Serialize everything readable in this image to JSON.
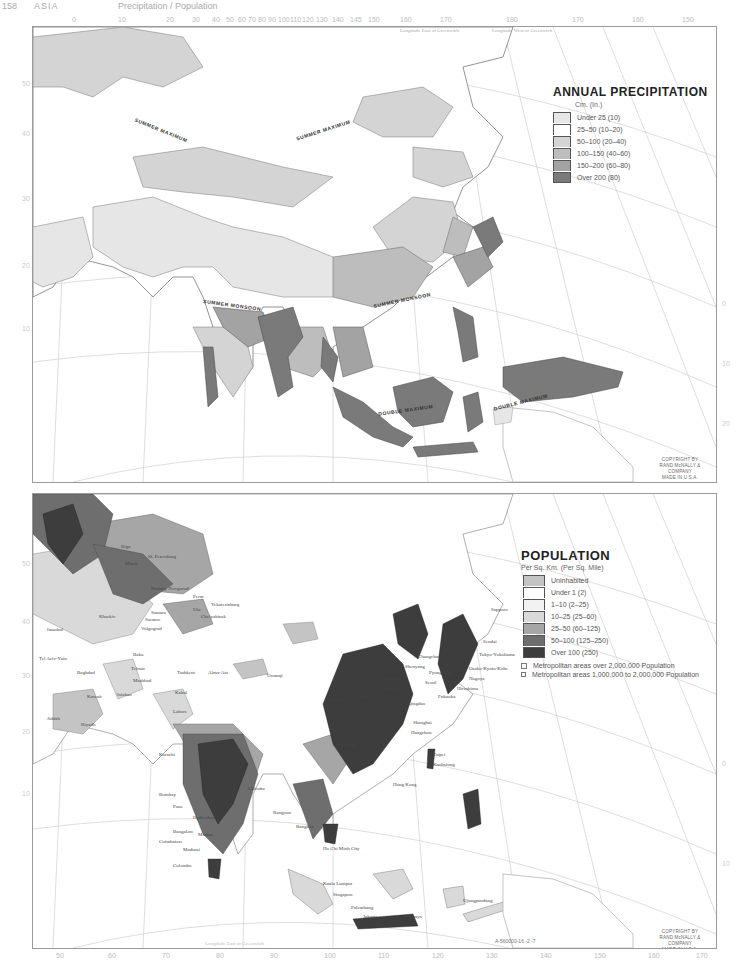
{
  "page": {
    "number": "158",
    "section": "ASIA",
    "subtitle": "Precipitation / Population"
  },
  "precipitation_map": {
    "legend": {
      "title": "ANNUAL PRECIPITATION",
      "unit": "Cm. (In.)",
      "items": [
        {
          "label": "Under 25 (10)",
          "color": "#e6e6e6"
        },
        {
          "label": "25–50 (10–20)",
          "color": "#ffffff"
        },
        {
          "label": "50–100 (20–40)",
          "color": "#d4d4d4"
        },
        {
          "label": "100–150 (40–60)",
          "color": "#bdbdbd"
        },
        {
          "label": "150–200 (60–80)",
          "color": "#a3a3a3"
        },
        {
          "label": "Over 200 (80)",
          "color": "#7a7a7a"
        }
      ]
    },
    "region_labels": [
      {
        "text": "SUMMER MAXIMUM",
        "x": 100,
        "y": 100,
        "rotate": 22
      },
      {
        "text": "SUMMER MAXIMUM",
        "x": 262,
        "y": 100,
        "rotate": -18
      },
      {
        "text": "SUMMER MONSOON",
        "x": 170,
        "y": 275,
        "rotate": 8
      },
      {
        "text": "SUMMER MONSOON",
        "x": 340,
        "y": 270,
        "rotate": -12
      },
      {
        "text": "DOUBLE MAXIMUM",
        "x": 345,
        "y": 380,
        "rotate": -8
      },
      {
        "text": "DOUBLE MAXIMUM",
        "x": 460,
        "y": 372,
        "rotate": -14
      }
    ],
    "top_ticks": [
      "0",
      "10",
      "20",
      "30",
      "40",
      "50",
      "60",
      "70",
      "80",
      "90",
      "100",
      "110",
      "120",
      "130",
      "140",
      "145",
      "150",
      "160",
      "170",
      "180",
      "170",
      "160",
      "150"
    ],
    "top_caption_east": "Longitude East of Greenwich",
    "top_caption_west": "Longitude West of Greenwich",
    "side_ticks": [
      "50",
      "40",
      "30",
      "20",
      "10",
      "0",
      "10",
      "20"
    ],
    "copyright": [
      "COPYRIGHT BY",
      "RAND McNALLY & COMPANY",
      "MADE IN U.S.A."
    ]
  },
  "population_map": {
    "legend": {
      "title": "POPULATION",
      "unit": "Per Sq. Km. (Per Sq. Mile)",
      "items": [
        {
          "label": "Uninhabited",
          "color": "#c4c4c4"
        },
        {
          "label": "Under 1 (2)",
          "color": "#ffffff"
        },
        {
          "label": "1–10 (2–25)",
          "color": "#f2f2f2"
        },
        {
          "label": "10–25 (25–60)",
          "color": "#d9d9d9"
        },
        {
          "label": "25–50 (60–125)",
          "color": "#a6a6a6"
        },
        {
          "label": "50–100 (125–250)",
          "color": "#6e6e6e"
        },
        {
          "label": "Over 100 (250)",
          "color": "#3d3d3d"
        }
      ],
      "metro": [
        {
          "label": "Metropolitan areas over 2,000,000 Population",
          "symbol": "square-large"
        },
        {
          "label": "Metropolitan areas 1,000,000 to 2,000,000 Population",
          "symbol": "square-small"
        }
      ]
    },
    "cities": [
      {
        "name": "Riga",
        "x": 88,
        "y": 50
      },
      {
        "name": "Minsk",
        "x": 92,
        "y": 67
      },
      {
        "name": "St. Petersburg",
        "x": 115,
        "y": 60
      },
      {
        "name": "Nizhniy Novgorod",
        "x": 118,
        "y": 92
      },
      {
        "name": "Perm",
        "x": 160,
        "y": 100
      },
      {
        "name": "Ufa",
        "x": 160,
        "y": 113
      },
      {
        "name": "Yekaterinburg",
        "x": 178,
        "y": 112
      },
      {
        "name": "Chelyabinsk",
        "x": 168,
        "y": 120
      },
      {
        "name": "Samara",
        "x": 118,
        "y": 116
      },
      {
        "name": "Saratov",
        "x": 112,
        "y": 123
      },
      {
        "name": "Volgograd",
        "x": 108,
        "y": 132
      },
      {
        "name": "Kharkiv",
        "x": 66,
        "y": 120
      },
      {
        "name": "Istanbul",
        "x": 14,
        "y": 133
      },
      {
        "name": "Tel Aviv-Yafo",
        "x": 6,
        "y": 162
      },
      {
        "name": "Baghdad",
        "x": 44,
        "y": 176
      },
      {
        "name": "Baku",
        "x": 100,
        "y": 158
      },
      {
        "name": "Tehran",
        "x": 98,
        "y": 172
      },
      {
        "name": "Mashhad",
        "x": 100,
        "y": 184
      },
      {
        "name": "Riyadh",
        "x": 48,
        "y": 228
      },
      {
        "name": "Kuwait",
        "x": 54,
        "y": 200
      },
      {
        "name": "Jiddah",
        "x": 14,
        "y": 222
      },
      {
        "name": "Isfahan",
        "x": 84,
        "y": 198
      },
      {
        "name": "Tashkent",
        "x": 144,
        "y": 176
      },
      {
        "name": "Alma-Ata",
        "x": 175,
        "y": 176
      },
      {
        "name": "Kabul",
        "x": 142,
        "y": 196
      },
      {
        "name": "Lahore",
        "x": 140,
        "y": 215
      },
      {
        "name": "Karachi",
        "x": 126,
        "y": 258
      },
      {
        "name": "Urumqi",
        "x": 234,
        "y": 179
      },
      {
        "name": "Bombay",
        "x": 126,
        "y": 298
      },
      {
        "name": "Pune",
        "x": 140,
        "y": 310
      },
      {
        "name": "Hyderabad",
        "x": 160,
        "y": 321
      },
      {
        "name": "Bangalore",
        "x": 140,
        "y": 335
      },
      {
        "name": "Madras",
        "x": 165,
        "y": 338
      },
      {
        "name": "Coimbatore",
        "x": 126,
        "y": 345
      },
      {
        "name": "Madurai",
        "x": 150,
        "y": 353
      },
      {
        "name": "Colombo",
        "x": 140,
        "y": 369
      },
      {
        "name": "Calcutta",
        "x": 215,
        "y": 292
      },
      {
        "name": "Rangoon",
        "x": 240,
        "y": 316
      },
      {
        "name": "Bangkok",
        "x": 263,
        "y": 330
      },
      {
        "name": "Ho Chi Minh City",
        "x": 290,
        "y": 352
      },
      {
        "name": "Kuala Lumpur",
        "x": 290,
        "y": 387
      },
      {
        "name": "Singapore",
        "x": 300,
        "y": 398
      },
      {
        "name": "Palembang",
        "x": 318,
        "y": 411
      },
      {
        "name": "Jakarta",
        "x": 330,
        "y": 425
      },
      {
        "name": "Surabaya",
        "x": 370,
        "y": 425
      },
      {
        "name": "Ujungpandang",
        "x": 430,
        "y": 404
      },
      {
        "name": "Hong Kong",
        "x": 360,
        "y": 288
      },
      {
        "name": "Taipei",
        "x": 395,
        "y": 260
      },
      {
        "name": "Kaohsiung",
        "x": 395,
        "y": 270
      },
      {
        "name": "Shanghai",
        "x": 380,
        "y": 226
      },
      {
        "name": "Hangzhou",
        "x": 378,
        "y": 236
      },
      {
        "name": "Qingdao",
        "x": 375,
        "y": 207
      },
      {
        "name": "Tianjin",
        "x": 360,
        "y": 190
      },
      {
        "name": "Beijing",
        "x": 362,
        "y": 182
      },
      {
        "name": "Shenyang",
        "x": 386,
        "y": 170
      },
      {
        "name": "Changchun",
        "x": 394,
        "y": 160
      },
      {
        "name": "Pyongyang",
        "x": 395,
        "y": 178
      },
      {
        "name": "Seoul",
        "x": 400,
        "y": 186
      },
      {
        "name": "Fukuoka",
        "x": 405,
        "y": 202
      },
      {
        "name": "Nagoya",
        "x": 428,
        "y": 190
      },
      {
        "name": "Osaka-Kyoto-Kobe",
        "x": 430,
        "y": 182
      },
      {
        "name": "Hiroshima",
        "x": 418,
        "y": 196
      },
      {
        "name": "Tokyo-Yokohama",
        "x": 446,
        "y": 165
      },
      {
        "name": "Sendai",
        "x": 450,
        "y": 148
      },
      {
        "name": "Sapporo",
        "x": 458,
        "y": 115
      },
      {
        "name": "Taiyuan",
        "x": 330,
        "y": 200
      },
      {
        "name": "Lanzhou",
        "x": 300,
        "y": 204
      },
      {
        "name": "Chongqing",
        "x": 300,
        "y": 248
      }
    ],
    "bottom_ticks": [
      "50",
      "60",
      "70",
      "80",
      "90",
      "100",
      "110",
      "120",
      "130",
      "140",
      "150",
      "160",
      "170"
    ],
    "bottom_caption": "Longitude East of Greenwich",
    "side_ticks": [
      "50",
      "40",
      "30",
      "20",
      "10",
      "0",
      "10"
    ],
    "ref_code": "A-560000-16 -2 -7",
    "copyright": [
      "COPYRIGHT BY",
      "RAND McNALLY & COMPANY",
      "MADE IN U.S.A."
    ]
  }
}
